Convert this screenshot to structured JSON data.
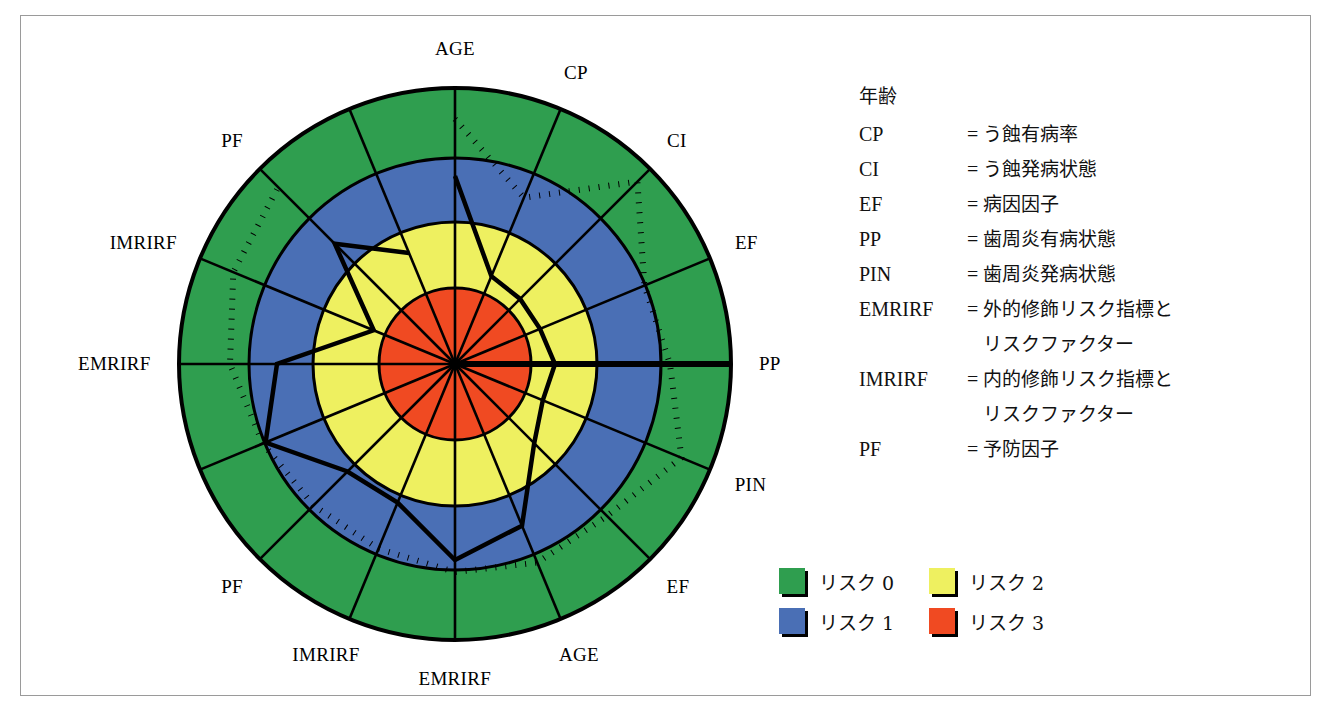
{
  "figure": {
    "type": "radar-risk-diagram",
    "center": {
      "x": 434,
      "y": 348
    },
    "outer_radius": 276,
    "ring_colors": {
      "risk0": "#2f9e4f",
      "risk1": "#4a6fb5",
      "risk2": "#eef060",
      "risk3": "#f04a22"
    },
    "ring_radii": {
      "risk3_outer": 76,
      "risk2_outer": 142,
      "risk1_outer": 206,
      "risk0_outer": 276
    }
  },
  "axis_labels": [
    {
      "name": "AGE",
      "angle_deg": 90,
      "label": "AGE"
    },
    {
      "name": "CP",
      "angle_deg": 67.5,
      "label": "CP"
    },
    {
      "name": "CI",
      "angle_deg": 45,
      "label": "CI"
    },
    {
      "name": "EF",
      "angle_deg": 22.5,
      "label": "EF"
    },
    {
      "name": "PP",
      "angle_deg": 0,
      "label": "PP"
    },
    {
      "name": "PIN",
      "angle_deg": -22.5,
      "label": "PIN"
    },
    {
      "name": "EF2",
      "angle_deg": -45,
      "label": "EF"
    },
    {
      "name": "AGE2",
      "angle_deg": -67.5,
      "label": "AGE"
    },
    {
      "name": "EMRIRF2",
      "angle_deg": -90,
      "label": "EMRIRF"
    },
    {
      "name": "IMRIRF2",
      "angle_deg": -112.5,
      "label": "IMRIRF"
    },
    {
      "name": "PF2",
      "angle_deg": -135,
      "label": "PF"
    },
    {
      "name": "EMRIRF",
      "angle_deg": 180,
      "label": "EMRIRF"
    },
    {
      "name": "IMRIRF",
      "angle_deg": 157.5,
      "label": "IMRIRF"
    },
    {
      "name": "PF",
      "angle_deg": 135,
      "label": "PF"
    }
  ],
  "chart_data": {
    "type": "radar",
    "title": "",
    "categories": [
      "AGE",
      "CP",
      "CI",
      "EF",
      "PP",
      "PIN",
      "EF",
      "AGE",
      "EMRIRF",
      "IMRIRF",
      "PF",
      "EMRIRF",
      "IMRIRF",
      "PF",
      "AGE*",
      "CP*"
    ],
    "angles_deg": [
      90,
      67.5,
      45,
      22.5,
      0,
      -22.5,
      -45,
      -67.5,
      -90,
      -112.5,
      -135,
      -157.5,
      180,
      157.5,
      112.5
    ],
    "rings": [
      {
        "label": "リスク 0",
        "value": 0,
        "color": "#2f9e4f",
        "outer_radius": 276
      },
      {
        "label": "リスク 1",
        "value": 1,
        "color": "#4a6fb5",
        "outer_radius": 206
      },
      {
        "label": "リスク 2",
        "value": 2,
        "color": "#eef060",
        "outer_radius": 142
      },
      {
        "label": "リスク 3",
        "value": 3,
        "color": "#f04a22",
        "outer_radius": 76
      }
    ],
    "series": [
      {
        "name": "solid-profile",
        "style": "solid",
        "axis_order": [
          "AGE",
          "CP",
          "CI",
          "EF",
          "PP",
          "PIN",
          "EF2",
          "AGE2",
          "EMRIRF2",
          "IMRIRF2",
          "PF2",
          "EMRIRF",
          "IMRIRF",
          "PF",
          "AGE-b",
          "CP-b"
        ],
        "radii": [
          188,
          95,
          92,
          92,
          100,
          95,
          112,
          175,
          196,
          150,
          152,
          205,
          178,
          88,
          170,
          120
        ]
      },
      {
        "name": "dotted-profile",
        "style": "dotted",
        "axis_order": [
          "AGE",
          "CP",
          "CI",
          "EF",
          "PP",
          "PIN",
          "EF2",
          "AGE2",
          "EMRIRF2",
          "IMRIRF2",
          "PF2",
          "EMRIRF",
          "IMRIRF",
          "PF",
          "AGE-b"
        ],
        "radii": [
          245,
          180,
          258,
          205,
          215,
          245,
          215,
          215,
          208,
          200,
          200,
          208,
          225,
          240,
          250
        ]
      }
    ],
    "xlabel": "",
    "ylabel": "",
    "grid": true,
    "legend_position": "bottom-right"
  },
  "abbrev_legend": {
    "title": "年齢",
    "rows": [
      {
        "key": "CP",
        "eq": "=",
        "value": "う蝕有病率"
      },
      {
        "key": "CI",
        "eq": "=",
        "value": "う蝕発病状態"
      },
      {
        "key": "EF",
        "eq": "=",
        "value": "病因因子"
      },
      {
        "key": "PP",
        "eq": "=",
        "value": "歯周炎有病状態"
      },
      {
        "key": "PIN",
        "eq": "=",
        "value": "歯周炎発病状態"
      },
      {
        "key": "EMRIRF",
        "eq": "=",
        "value": "外的修飾リスク指標と",
        "cont": "リスクファクター"
      },
      {
        "key": "IMRIRF",
        "eq": "=",
        "value": "内的修飾リスク指標と",
        "cont": "リスクファクター"
      },
      {
        "key": "PF",
        "eq": "=",
        "value": "予防因子"
      }
    ]
  },
  "risk_legend": {
    "items": [
      {
        "label": "リスク 0",
        "color": "#2f9e4f"
      },
      {
        "label": "リスク 2",
        "color": "#eef060"
      },
      {
        "label": "リスク 1",
        "color": "#4a6fb5"
      },
      {
        "label": "リスク 3",
        "color": "#f04a22"
      }
    ]
  }
}
